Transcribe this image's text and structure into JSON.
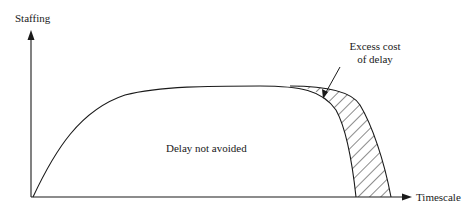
{
  "diagram": {
    "y_axis_label": "Staffing",
    "x_axis_label": "Timescale",
    "region_label": "Delay not avoided",
    "annotation_line1": "Excess cost",
    "annotation_line2": "of delay",
    "colors": {
      "ink": "#1a1a1a",
      "background": "#ffffff"
    }
  }
}
